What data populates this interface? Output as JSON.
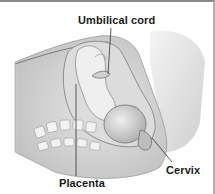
{
  "diagram": {
    "labels": {
      "umbilical_cord": "Umbilical cord",
      "placenta": "Placenta",
      "cervix": "Cervix"
    },
    "colors": {
      "background": "#ffffff",
      "border": "#8a8a8a",
      "tissue_light": "#e8e8e8",
      "tissue_mid": "#c4c4c4",
      "tissue_dark": "#8c8c8c",
      "leader_line": "#333333",
      "label_text": "#1a1a1a"
    }
  }
}
